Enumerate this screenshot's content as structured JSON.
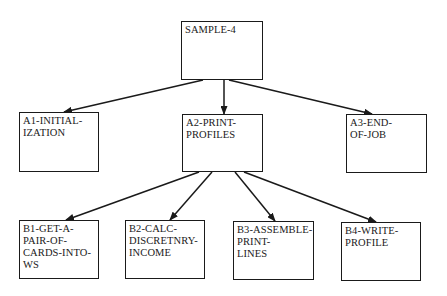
{
  "diagram": {
    "type": "structure-chart",
    "colors": {
      "line": "#1a1a1a",
      "background": "#ffffff"
    },
    "nodes": [
      {
        "id": "root",
        "label": "SAMPLE-4",
        "x": 181,
        "y": 21,
        "w": 82,
        "h": 59
      },
      {
        "id": "a1",
        "label": "A1-INITIAL-\nIZATION",
        "x": 19,
        "y": 112,
        "w": 80,
        "h": 60
      },
      {
        "id": "a2",
        "label": "A2-PRINT-\nPROFILES",
        "x": 182,
        "y": 114,
        "w": 81,
        "h": 58
      },
      {
        "id": "a3",
        "label": "A3-END-\nOF-JOB",
        "x": 346,
        "y": 114,
        "w": 81,
        "h": 59
      },
      {
        "id": "b1",
        "label": "B1-GET-A-\nPAIR-OF-\nCARDS-INTO-\nWS",
        "x": 19,
        "y": 220,
        "w": 80,
        "h": 59
      },
      {
        "id": "b2",
        "label": "B2-CALC-\nDISCRETNRY-\nINCOME",
        "x": 125,
        "y": 220,
        "w": 80,
        "h": 59
      },
      {
        "id": "b3",
        "label": "B3-ASSEMBLE-\nPRINT-\nLINES",
        "x": 233,
        "y": 221,
        "w": 81,
        "h": 59
      },
      {
        "id": "b4",
        "label": "B4-WRITE-\nPROFILE",
        "x": 341,
        "y": 222,
        "w": 80,
        "h": 59
      }
    ],
    "edges": [
      {
        "from": "root",
        "to": "a1",
        "x1": 203,
        "y1": 80,
        "x2": 64,
        "y2": 112
      },
      {
        "from": "root",
        "to": "a2",
        "x1": 224,
        "y1": 80,
        "x2": 224,
        "y2": 114
      },
      {
        "from": "root",
        "to": "a3",
        "x1": 229,
        "y1": 80,
        "x2": 372,
        "y2": 114
      },
      {
        "from": "a2",
        "to": "b1",
        "x1": 199,
        "y1": 172,
        "x2": 66,
        "y2": 220
      },
      {
        "from": "a2",
        "to": "b2",
        "x1": 212,
        "y1": 172,
        "x2": 170,
        "y2": 220
      },
      {
        "from": "a2",
        "to": "b3",
        "x1": 235,
        "y1": 172,
        "x2": 275,
        "y2": 221
      },
      {
        "from": "a2",
        "to": "b4",
        "x1": 244,
        "y1": 172,
        "x2": 376,
        "y2": 222
      }
    ]
  }
}
